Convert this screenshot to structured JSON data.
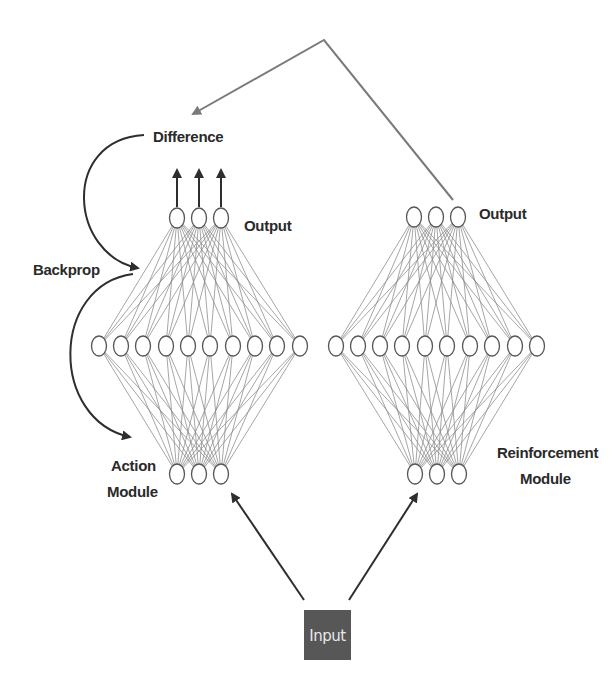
{
  "labels": {
    "difference": "Difference",
    "backprop": "Backprop",
    "left_output": "Output",
    "right_output": "Output",
    "action_module_line1": "Action",
    "action_module_line2": "Module",
    "reinforcement_module_line1": "Reinforcement",
    "reinforcement_module_line2": "Module",
    "input": "Input"
  },
  "colors": {
    "input_box": "#575757",
    "input_text": "#e8e8e8",
    "edges": "#8a8a8a",
    "arrows": "#2e2e2e",
    "feedback_line": "#7a7a7a"
  },
  "networks": [
    {
      "name": "action-module",
      "layers": {
        "output": {
          "count": 3,
          "x": [
            177,
            199,
            221
          ],
          "y": 218
        },
        "hidden": {
          "count": 10,
          "x": [
            99,
            121,
            143,
            166,
            188,
            210,
            233,
            255,
            277,
            300
          ],
          "y": 346
        },
        "input": {
          "count": 3,
          "x": [
            177,
            199,
            221
          ],
          "y": 474
        }
      }
    },
    {
      "name": "reinforcement-module",
      "layers": {
        "output": {
          "count": 3,
          "x": [
            414,
            436,
            458
          ],
          "y": 217
        },
        "hidden": {
          "count": 10,
          "x": [
            336,
            358,
            380,
            402,
            425,
            447,
            470,
            492,
            515,
            537
          ],
          "y": 346
        },
        "input": {
          "count": 3,
          "x": [
            415,
            437,
            459
          ],
          "y": 474
        }
      }
    }
  ]
}
